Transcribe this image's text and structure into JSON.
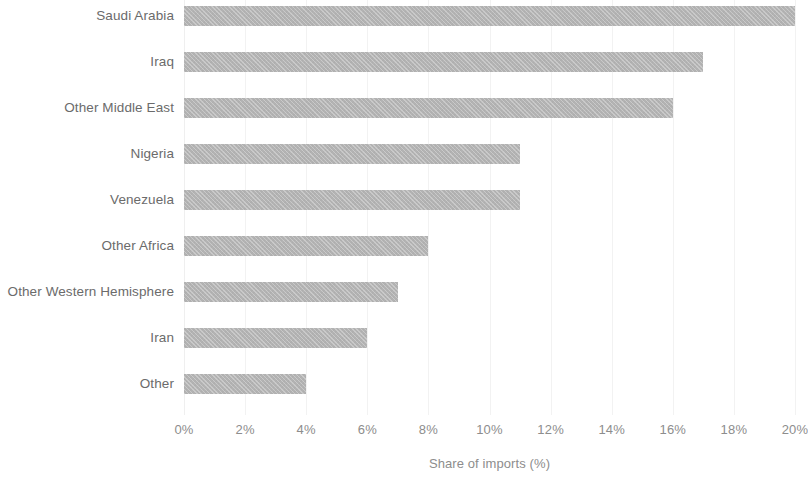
{
  "chart_data": {
    "type": "bar",
    "orientation": "horizontal",
    "title": "",
    "subtitle": "",
    "xlabel": "Share of imports (%)",
    "ylabel": "",
    "categories": [
      "Saudi Arabia",
      "Iraq",
      "Other Middle East",
      "Nigeria",
      "Venezuela",
      "Other Africa",
      "Other Western Hemisphere",
      "Iran",
      "Other"
    ],
    "values": [
      20,
      17,
      16,
      11,
      11,
      8,
      7,
      6,
      4
    ],
    "value_unit": "%",
    "xlim": [
      0,
      20
    ],
    "xtick_values": [
      0,
      2,
      4,
      6,
      8,
      10,
      12,
      14,
      16,
      18,
      20
    ],
    "xtick_labels": [
      "0%",
      "2%",
      "4%",
      "6%",
      "8%",
      "10%",
      "12%",
      "14%",
      "16%",
      "18%",
      "20%"
    ],
    "grid": "vertical-faint",
    "legend": "none",
    "legend_position": "",
    "annotations": [],
    "colors": {
      "bar_fill": "#b3b3b3",
      "category_label": "#6b6b6b",
      "tick_label": "#8d8d8d",
      "axis_title": "#8d8d8d",
      "gridline": "#f2f2f2",
      "background": "#ffffff"
    }
  }
}
